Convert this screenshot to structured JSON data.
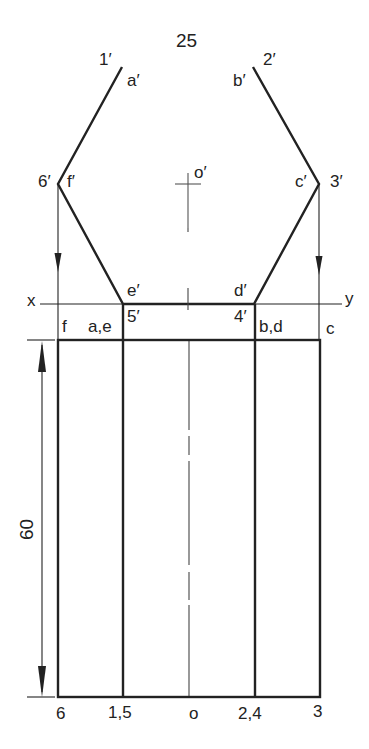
{
  "diagram": {
    "type": "orthographic-projection",
    "colors": {
      "line": "#222222",
      "background": "#ffffff"
    },
    "dimensions": {
      "width_label": "25",
      "height_label": "60"
    },
    "reference_line": {
      "left": "x",
      "right": "y"
    },
    "top_view_labels": {
      "p1": "1′",
      "a": "a′",
      "p2": "2′",
      "b": "b′",
      "p6": "6′",
      "f": "f′",
      "p3": "3′",
      "c": "c′",
      "e": "e′",
      "p5": "5′",
      "d": "d′",
      "p4": "4′",
      "center": "o′"
    },
    "front_view_top_labels": {
      "f": "f",
      "ae": "a,e",
      "bd": "b,d",
      "c": "c"
    },
    "front_view_bottom_labels": {
      "p6": "6",
      "p15": "1,5",
      "o": "o",
      "p24": "2,4",
      "p3": "3"
    }
  }
}
